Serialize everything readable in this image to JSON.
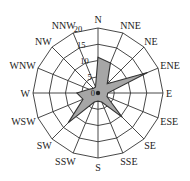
{
  "chart_data": {
    "type": "radar",
    "title": "",
    "subtitle": "",
    "categories": [
      "N",
      "NNE",
      "NE",
      "ENE",
      "E",
      "ESE",
      "SE",
      "SSE",
      "S",
      "SSW",
      "SW",
      "WSW",
      "W",
      "WNW",
      "NW",
      "NNW"
    ],
    "values": [
      11,
      10,
      4,
      16.5,
      3,
      3,
      10.5,
      3,
      2.5,
      3,
      13,
      5,
      6.5,
      3,
      2,
      2
    ],
    "radial_ticks": [
      0,
      5,
      10,
      15,
      20
    ],
    "radial_tick_labels": [
      "0",
      "5",
      "10",
      "15",
      "20"
    ],
    "rlim": [
      0,
      20
    ],
    "grid": true,
    "grid_shape": "polygon",
    "legend": null,
    "fill_color": "#a6a6a6",
    "line_color": "#333333"
  }
}
